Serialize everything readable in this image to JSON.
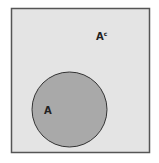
{
  "diagram": {
    "type": "venn",
    "universe": {
      "fill": "#e4e4e4",
      "stroke": "#555555"
    },
    "set_a": {
      "label": "A",
      "fill": "#a9a9a9",
      "stroke": "#333333"
    },
    "complement": {
      "label": "A",
      "superscript": "c"
    }
  }
}
